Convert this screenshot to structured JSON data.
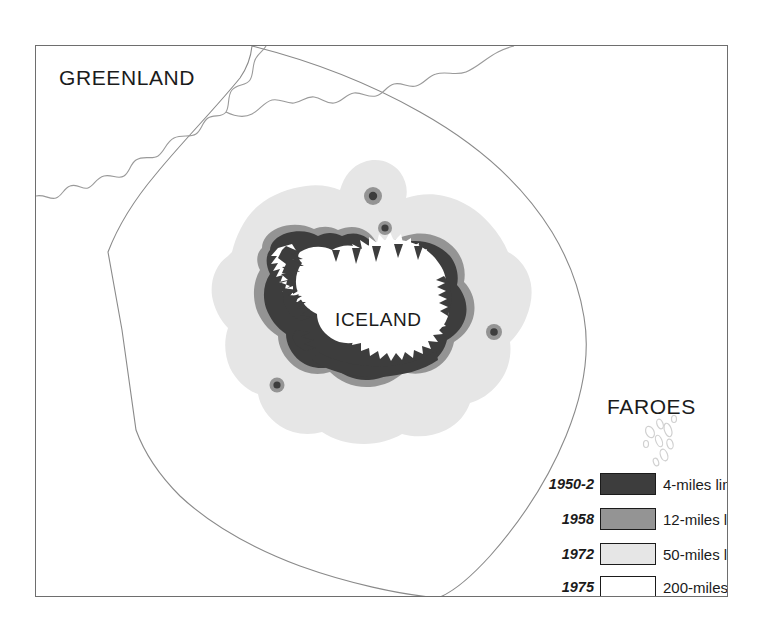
{
  "map": {
    "title_regions": {
      "greenland": "GREENLAND",
      "iceland": "ICELAND",
      "faroes": "FAROES"
    },
    "colors": {
      "frame_line": "#6e6e6e",
      "limit_200_line": "#8a8a8a",
      "coast_line": "#9a9a9a",
      "zone_4_miles": "#3d3d3d",
      "zone_12_miles": "#949494",
      "zone_50_miles": "#e6e6e6",
      "zone_200_miles": "#ffffff",
      "land_fill": "#ffffff",
      "faroes_outline": "#d0d0d0",
      "marker_core": "#3d3d3d",
      "marker_ring": "#949494",
      "text": "#1b1b1b",
      "background": "#ffffff"
    },
    "legend": {
      "items": [
        {
          "year": "1950-2",
          "label": "4-miles limit",
          "swatch": "#3d3d3d"
        },
        {
          "year": "1958",
          "label": "12-miles limit",
          "swatch": "#949494"
        },
        {
          "year": "1972",
          "label": "50-miles limit",
          "swatch": "#e6e6e6"
        },
        {
          "year": "1975",
          "label": "200-miles limit",
          "swatch": "#ffffff"
        }
      ]
    },
    "markers": [
      {
        "name": "grimsey-island",
        "cx": 373,
        "cy": 196,
        "r_outer": 9,
        "r_inner": 4.2
      },
      {
        "name": "kolbeinsey-island",
        "cx": 385,
        "cy": 228,
        "r_outer": 7,
        "r_inner": 3.6
      },
      {
        "name": "east-point-marker",
        "cx": 494,
        "cy": 332,
        "r_outer": 8,
        "r_inner": 3.8
      },
      {
        "name": "southwest-point-marker",
        "cx": 277,
        "cy": 385,
        "r_outer": 7.5,
        "r_inner": 3.6
      }
    ]
  }
}
